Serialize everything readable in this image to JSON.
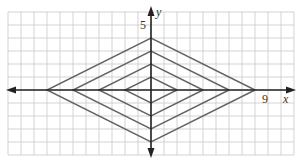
{
  "graph": {
    "x_axis_label": "x",
    "y_axis_label": "y",
    "x_tick_label": "9",
    "y_tick_label": "5",
    "grid": {
      "x_min": -11,
      "x_max": 11,
      "y_min": -5,
      "y_max": 6
    },
    "colors": {
      "grid": "#c8c8c8",
      "axis": "#222222",
      "curve": "#666666"
    }
  },
  "chart_data": {
    "type": "line",
    "title": "",
    "xlabel": "x",
    "ylabel": "y",
    "xlim": [
      -11,
      11
    ],
    "ylim": [
      -5,
      6
    ],
    "grid": true,
    "annotations": [
      "9 (x-axis)",
      "5 (y-axis)"
    ],
    "series": [
      {
        "name": "|x|/2 + |y| = 1",
        "x": [
          2,
          0,
          -2,
          0,
          2
        ],
        "y": [
          0,
          1,
          0,
          -1,
          0
        ]
      },
      {
        "name": "|x|/2 + |y| = 2",
        "x": [
          4,
          0,
          -4,
          0,
          4
        ],
        "y": [
          0,
          2,
          0,
          -2,
          0
        ]
      },
      {
        "name": "|x|/2 + |y| = 3",
        "x": [
          6,
          0,
          -6,
          0,
          6
        ],
        "y": [
          0,
          3,
          0,
          -3,
          0
        ]
      },
      {
        "name": "|x|/2 + |y| = 4",
        "x": [
          8,
          0,
          -8,
          0,
          8
        ],
        "y": [
          0,
          4,
          0,
          -4,
          0
        ]
      }
    ]
  }
}
